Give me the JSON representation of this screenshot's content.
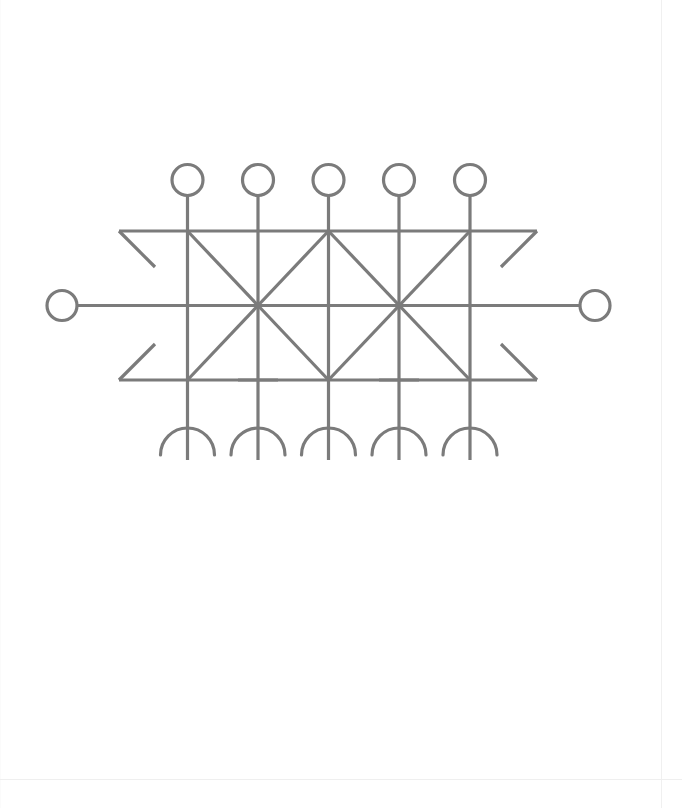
{
  "document": {
    "type": "scanned-page",
    "background_color": "#ffffff",
    "page_width": 682,
    "page_height": 808,
    "title": "Symmetric line-drawing glyph figure"
  },
  "figure": {
    "name": "bind-rune-lattice-glyph",
    "description": "A horizontally symmetric line glyph: five vertical staves topped with open circles and ended with downward-opening semicircular arcs, crossed by two long horizontal rails whose ends splay into arrowhead-like diagonals, plus two large X saltire crossings between the rails.",
    "stroke_color": "#7b7b7b",
    "stroke_width": 3.2,
    "stroke_style": "uniform hand-drawn straight strokes",
    "geometry": {
      "stave_x_positions": [
        187.5,
        258,
        328.5,
        399,
        470
      ],
      "stave_top_y": 196,
      "stave_bottom_y": 460,
      "top_rail_y": 231,
      "mid_rail_y": 305.5,
      "bottom_rail_y": 380,
      "rail_left_x": 119,
      "rail_right_x": 537,
      "mid_rail_left_x": 77,
      "mid_rail_right_x": 580,
      "saltire_centers_x": [
        258,
        399
      ],
      "top_circle_radius": 15.5,
      "top_circle_center_y": 180,
      "side_circle_radius": 15.0,
      "side_circle_center_y": 305.5,
      "side_circle_left_center_x": 62,
      "side_circle_right_center_x": 595,
      "arc_radius": 27,
      "arc_center_y": 455,
      "crossbar_half_width": 20,
      "crossbar_y": 380,
      "crossbar_x_positions": [
        258,
        399
      ],
      "diagonal_flare_length": 36
    },
    "element_counts": {
      "top_circles": 5,
      "side_circles": 2,
      "vertical_staves": 5,
      "horizontal_rails": 3,
      "saltire_crossings": 2,
      "bottom_arcs": 5,
      "short_crossbars": 2,
      "corner_flares": 4
    }
  },
  "chart_data": {
    "type": "line",
    "xlabel": "",
    "ylabel": "",
    "note": "Not a quantitative chart; coordinates describe drawn strokes in page pixel space.",
    "xlim": [
      0,
      682
    ],
    "ylim": [
      808,
      0
    ],
    "grid": false,
    "series": [
      {
        "name": "top-circles",
        "shape": "circle",
        "radius": 15.5,
        "points": [
          {
            "cx": 187.5,
            "cy": 180
          },
          {
            "cx": 258.0,
            "cy": 180
          },
          {
            "cx": 328.5,
            "cy": 180
          },
          {
            "cx": 399.0,
            "cy": 180
          },
          {
            "cx": 470.0,
            "cy": 180
          }
        ]
      },
      {
        "name": "side-circles",
        "shape": "circle",
        "radius": 15.0,
        "points": [
          {
            "cx": 62.0,
            "cy": 305.5
          },
          {
            "cx": 595.0,
            "cy": 305.5
          }
        ]
      },
      {
        "name": "vertical-staves",
        "shape": "segment",
        "segments": [
          {
            "x1": 187.5,
            "y1": 196,
            "x2": 187.5,
            "y2": 460
          },
          {
            "x1": 258.0,
            "y1": 196,
            "x2": 258.0,
            "y2": 460
          },
          {
            "x1": 328.5,
            "y1": 196,
            "x2": 328.5,
            "y2": 460
          },
          {
            "x1": 399.0,
            "y1": 196,
            "x2": 399.0,
            "y2": 460
          },
          {
            "x1": 470.0,
            "y1": 196,
            "x2": 470.0,
            "y2": 460
          }
        ]
      },
      {
        "name": "horizontal-rails",
        "shape": "segment",
        "segments": [
          {
            "x1": 119,
            "y1": 231,
            "x2": 537,
            "y2": 231
          },
          {
            "x1": 77,
            "y1": 305.5,
            "x2": 580,
            "y2": 305.5
          },
          {
            "x1": 119,
            "y1": 380,
            "x2": 537,
            "y2": 380
          }
        ]
      },
      {
        "name": "corner-flares",
        "shape": "segment",
        "segments": [
          {
            "x1": 119,
            "y1": 231,
            "x2": 155,
            "y2": 267
          },
          {
            "x1": 537,
            "y1": 231,
            "x2": 501,
            "y2": 267
          },
          {
            "x1": 119,
            "y1": 380,
            "x2": 155,
            "y2": 344
          },
          {
            "x1": 537,
            "y1": 380,
            "x2": 501,
            "y2": 344
          }
        ]
      },
      {
        "name": "saltire-left",
        "shape": "segment",
        "segments": [
          {
            "x1": 187.5,
            "y1": 231,
            "x2": 328.5,
            "y2": 380
          },
          {
            "x1": 328.5,
            "y1": 231,
            "x2": 187.5,
            "y2": 380
          }
        ]
      },
      {
        "name": "saltire-right",
        "shape": "segment",
        "segments": [
          {
            "x1": 328.5,
            "y1": 231,
            "x2": 470.0,
            "y2": 380
          },
          {
            "x1": 470.0,
            "y1": 231,
            "x2": 328.5,
            "y2": 380
          }
        ]
      },
      {
        "name": "short-crossbars",
        "shape": "segment",
        "segments": [
          {
            "x1": 238,
            "y1": 380,
            "x2": 278,
            "y2": 380
          },
          {
            "x1": 379,
            "y1": 380,
            "x2": 419,
            "y2": 380
          }
        ]
      },
      {
        "name": "bottom-arcs",
        "shape": "semicircle-down",
        "radius": 27,
        "points": [
          {
            "cx": 187.5,
            "cy": 455
          },
          {
            "cx": 258.0,
            "cy": 455
          },
          {
            "cx": 328.5,
            "cy": 455
          },
          {
            "cx": 399.0,
            "cy": 455
          },
          {
            "cx": 470.0,
            "cy": 455
          }
        ]
      }
    ]
  }
}
